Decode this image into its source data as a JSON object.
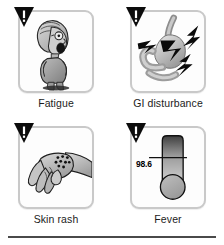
{
  "figure": {
    "rule_color": "#4a4a4a",
    "card_border_color": "#c9c9c9"
  },
  "cells": [
    {
      "id": "fatigue",
      "label": "Fatigue",
      "warning_icon": "warning-triangle-icon",
      "illustration": "tired-elderly-person-illustration"
    },
    {
      "id": "gi-disturbance",
      "label": "GI disturbance",
      "warning_icon": "warning-triangle-icon",
      "illustration": "stomach-intestine-lightning-illustration"
    },
    {
      "id": "skin-rash",
      "label": "Skin rash",
      "warning_icon": "warning-triangle-icon",
      "illustration": "hand-with-rash-spots-illustration"
    },
    {
      "id": "fever",
      "label": "Fever",
      "warning_icon": "warning-triangle-icon",
      "illustration": "thermometer-illustration",
      "thermometer": {
        "reading": "98.6",
        "top_color": "#3f3f3f",
        "bottom_color": "#d2d2d2",
        "outline_color": "#111111"
      }
    }
  ]
}
